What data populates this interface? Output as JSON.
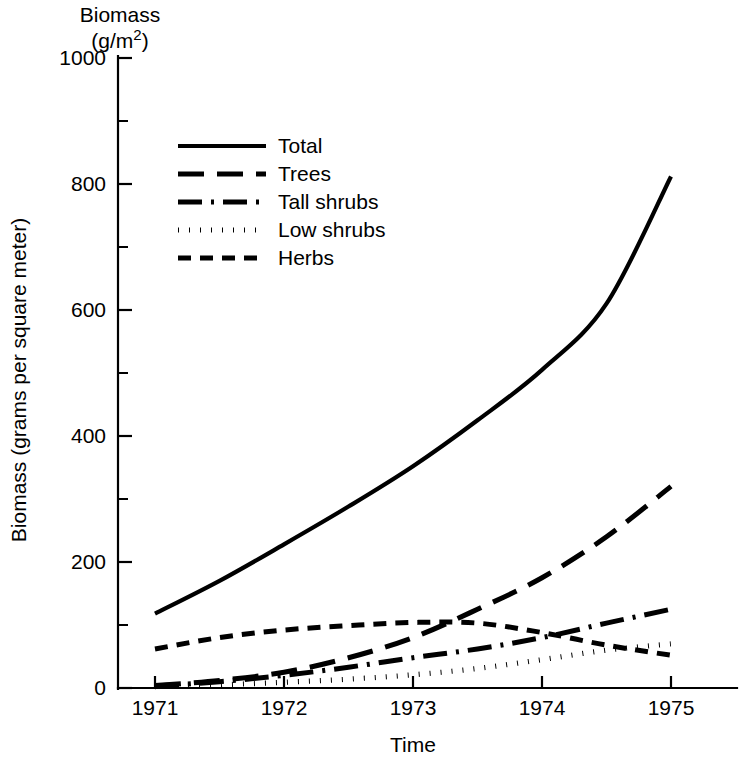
{
  "chart_data": {
    "type": "line",
    "title": "Biomass (g/m2)",
    "title_line1": "Biomass",
    "title_line2_pre": "(g/m",
    "title_line2_sup": "2",
    "title_line2_post": ")",
    "xlabel": "Time",
    "ylabel": "Biomass (grams per square meter)",
    "xlim": [
      1970.6,
      1975.5
    ],
    "ylim": [
      0,
      1000
    ],
    "grid": false,
    "legend_position": "upper-left-inside",
    "x_ticks_major": [
      "1971",
      "1972",
      "1973",
      "1974",
      "1975"
    ],
    "x_tick_values": [
      1971,
      1972,
      1973,
      1974,
      1975
    ],
    "y_ticks_major": [
      "0",
      "200",
      "400",
      "600",
      "800",
      "1000"
    ],
    "y_tick_values": [
      0,
      200,
      400,
      600,
      800,
      1000
    ],
    "y_ticks_minor": [
      100,
      300,
      500,
      700,
      900
    ],
    "x": [
      1971,
      1971.5,
      1972,
      1972.5,
      1973,
      1973.5,
      1974,
      1974.5,
      1975
    ],
    "series": [
      {
        "name": "Total",
        "style": "solid",
        "values": [
          118,
          170,
          228,
          288,
          352,
          425,
          505,
          610,
          812
        ]
      },
      {
        "name": "Trees",
        "style": "long-dash",
        "values": [
          4,
          12,
          25,
          48,
          80,
          125,
          175,
          240,
          320
        ]
      },
      {
        "name": "Tall shrubs",
        "style": "dash-dot",
        "values": [
          3,
          10,
          20,
          33,
          48,
          62,
          80,
          103,
          125
        ]
      },
      {
        "name": "Low shrubs",
        "style": "dotted",
        "values": [
          2,
          5,
          9,
          14,
          21,
          31,
          45,
          60,
          70
        ]
      },
      {
        "name": "Herbs",
        "style": "short-dash",
        "values": [
          62,
          80,
          92,
          99,
          104,
          103,
          88,
          68,
          52
        ]
      }
    ]
  },
  "legend": {
    "items": [
      {
        "label": "Total",
        "style": "solid"
      },
      {
        "label": "Trees",
        "style": "long-dash"
      },
      {
        "label": "Tall shrubs",
        "style": "dash-dot"
      },
      {
        "label": "Low shrubs",
        "style": "dotted"
      },
      {
        "label": "Herbs",
        "style": "short-dash"
      }
    ]
  }
}
